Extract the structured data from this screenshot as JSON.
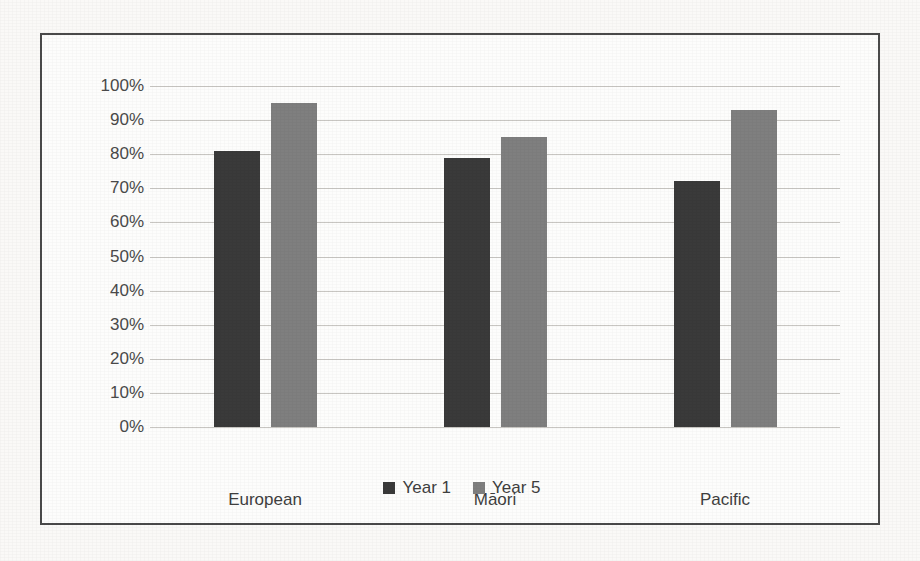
{
  "chart_data": {
    "type": "bar",
    "title": "",
    "xlabel": "",
    "ylabel": "",
    "categories": [
      "European",
      "Māori",
      "Pacific"
    ],
    "series": [
      {
        "name": "Year 1",
        "color": "#3a3a3a",
        "values": [
          81,
          79,
          72
        ]
      },
      {
        "name": "Year 5",
        "color": "#7f7f7f",
        "values": [
          95,
          85,
          93
        ]
      }
    ],
    "ylim": [
      0,
      100
    ],
    "ytick_step": 10,
    "ytick_labels": [
      "100%",
      "90%",
      "80%",
      "70%",
      "60%",
      "50%",
      "40%",
      "30%",
      "20%",
      "10%",
      "0%"
    ],
    "ytick_values": [
      100,
      90,
      80,
      70,
      60,
      50,
      40,
      30,
      20,
      10,
      0
    ],
    "grid": true,
    "legend_position": "bottom",
    "value_suffix": "%"
  },
  "legend": {
    "items": [
      {
        "label": "Year 1"
      },
      {
        "label": "Year 5"
      }
    ]
  },
  "background_text": {
    "line1": "",
    "line2": "",
    "line3": ""
  }
}
